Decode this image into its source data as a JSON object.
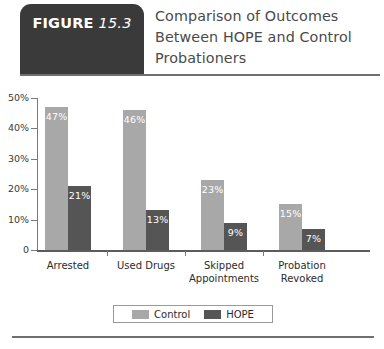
{
  "header": {
    "badge_word": "FIGURE",
    "badge_number": "15.3",
    "title_line1": "Comparison of Outcomes",
    "title_line2": "Between HOPE and Control",
    "title_line3": "Probationers"
  },
  "colors": {
    "control": "#a8a8a8",
    "hope": "#555555",
    "badge": "#3a3a3a",
    "rule": "#6f6f6f"
  },
  "legend": {
    "items": [
      {
        "label": "Control",
        "color": "#a8a8a8"
      },
      {
        "label": "HOPE",
        "color": "#555555"
      }
    ]
  },
  "chart_data": {
    "type": "bar",
    "title": "Comparison of Outcomes Between HOPE and Control Probationers",
    "xlabel": "",
    "ylabel": "",
    "ylim": [
      0,
      50
    ],
    "yticks": [
      0,
      10,
      20,
      30,
      40,
      50
    ],
    "ytick_labels": [
      "0",
      "10%",
      "20%",
      "30%",
      "40%",
      "50%"
    ],
    "grid": false,
    "legend_position": "bottom",
    "categories": [
      "Arrested",
      "Used Drugs",
      "Skipped Appointments",
      "Probation Revoked"
    ],
    "category_lines": [
      [
        "Arrested"
      ],
      [
        "Used Drugs"
      ],
      [
        "Skipped",
        "Appointments"
      ],
      [
        "Probation",
        "Revoked"
      ]
    ],
    "series": [
      {
        "name": "Control",
        "color": "#a8a8a8",
        "values": [
          47,
          46,
          23,
          15
        ],
        "labels": [
          "47%",
          "46%",
          "23%",
          "15%"
        ]
      },
      {
        "name": "HOPE",
        "color": "#555555",
        "values": [
          21,
          13,
          9,
          7
        ],
        "labels": [
          "21%",
          "13%",
          "9%",
          "7%"
        ]
      }
    ]
  }
}
